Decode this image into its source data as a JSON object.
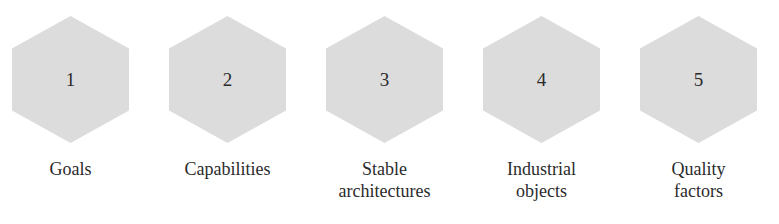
{
  "diagram": {
    "type": "hexagon-sequence",
    "orientation": "horizontal",
    "background_color": "#ffffff",
    "hexagon_fill_color": "#dcdcdc",
    "text_color": "#2b2b2b",
    "nodes": [
      {
        "number": "1",
        "label": "Goals"
      },
      {
        "number": "2",
        "label": "Capabilities"
      },
      {
        "number": "3",
        "label": "Stable\narchitectures"
      },
      {
        "number": "4",
        "label": "Industrial\nobjects"
      },
      {
        "number": "5",
        "label": "Quality\nfactors"
      }
    ]
  }
}
